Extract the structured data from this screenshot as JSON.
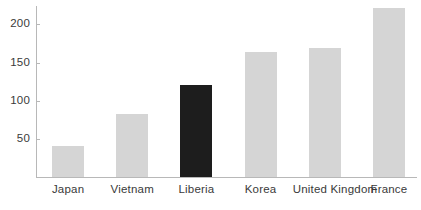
{
  "chart_data": {
    "type": "bar",
    "title": "",
    "subtitle": "",
    "xlabel": "",
    "ylabel": "",
    "categories": [
      "Japan",
      "Vietnam",
      "Liberia",
      "Korea",
      "United Kingdom",
      "France"
    ],
    "values": [
      41,
      83,
      120,
      164,
      169,
      222
    ],
    "highlight_category": "Liberia",
    "ylim": [
      0,
      232
    ],
    "yticks": [
      50,
      100,
      150,
      200
    ],
    "ytick_labels": [
      "50",
      "100",
      "150",
      "200"
    ],
    "grid": false,
    "legend": null,
    "legend_position": "none",
    "colors": {
      "bar": "#d5d5d5",
      "bar_highlight": "#1d1d1d",
      "axis": "#b8b8b8",
      "text": "#3a3a3a",
      "background": "#ffffff"
    }
  }
}
